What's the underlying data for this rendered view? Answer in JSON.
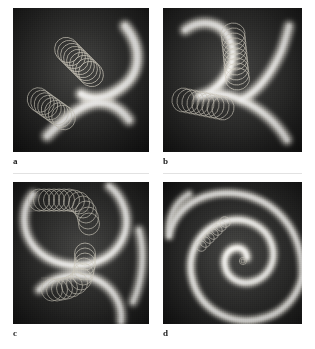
{
  "figure": {
    "kind": "multi-panel-micrograph-figure",
    "background_color": "#ffffff",
    "panel_background_color": "#111111",
    "wavefront_color": "#f2f0ea",
    "trajectory_color": "#cfcabc",
    "caption_label_color": "#1b1b1b",
    "panels": [
      {
        "id": "a",
        "label": "a",
        "x": 13,
        "y": 8,
        "w": 136,
        "h": 144,
        "description": "Two broad bright excitation wave arcs in an S / yin-yang arrangement with two diagonal chains of overlapping circular loops marking meandering spiral tip trajectories.",
        "wavefronts": 2,
        "trajectory_chains": 2,
        "loops_per_chain": [
          9,
          8
        ]
      },
      {
        "id": "b",
        "label": "b",
        "x": 163,
        "y": 8,
        "w": 139,
        "h": 144,
        "description": "Bright wave fronts forming a figure-eight like junction; a vertical chain of loops descends at upper right and a horizontal chain of loops lies at mid-left.",
        "wavefronts": 3,
        "trajectory_chains": 2,
        "loops_per_chain": [
          10,
          9
        ]
      },
      {
        "id": "c",
        "label": "c",
        "x": 13,
        "y": 182,
        "w": 136,
        "h": 142,
        "description": "Two large bright circular wave fronts; an L-shaped trajectory runs horizontally across the top then turns downward, and a second trajectory descends then turns left in the lower half.",
        "wavefronts": 3,
        "trajectory_chains": 2,
        "loops_per_chain": [
          13,
          12
        ]
      },
      {
        "id": "d",
        "label": "d",
        "x": 163,
        "y": 182,
        "w": 139,
        "h": 142,
        "description": "A single large Archimedean spiral wave with a compact diagonal chain of small loops at the upper left and a tiny loop at the spiral core.",
        "wavefronts": 1,
        "trajectory_chains": 1,
        "loops_per_chain": [
          7
        ]
      }
    ],
    "labels": [
      {
        "text": "a",
        "x": 13,
        "y": 157
      },
      {
        "text": "b",
        "x": 163,
        "y": 157
      },
      {
        "text": "c",
        "x": 13,
        "y": 329
      },
      {
        "text": "d",
        "x": 163,
        "y": 329
      }
    ]
  }
}
